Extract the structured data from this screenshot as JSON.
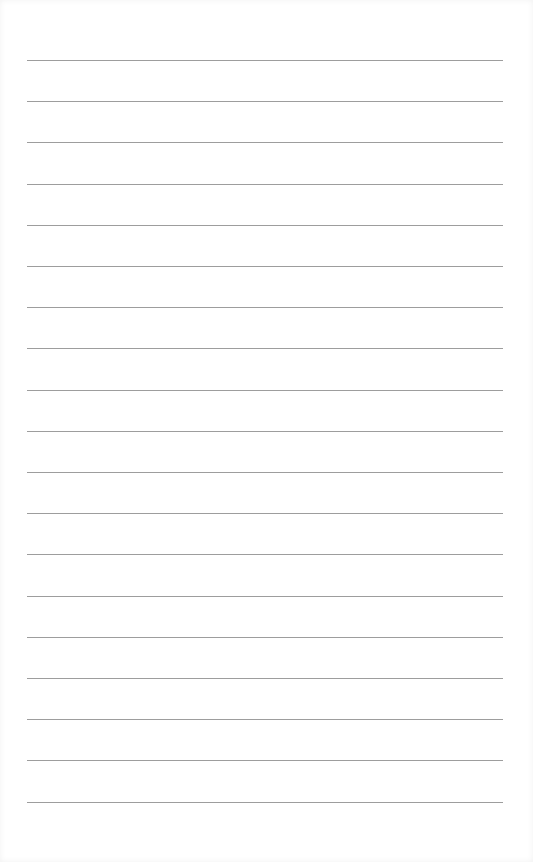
{
  "page": {
    "type": "lined-paper",
    "line_count": 19,
    "first_line_y": 60,
    "line_spacing": 41.2,
    "line_color": "#8c8c8c",
    "background": "#ffffff",
    "text_content": []
  }
}
